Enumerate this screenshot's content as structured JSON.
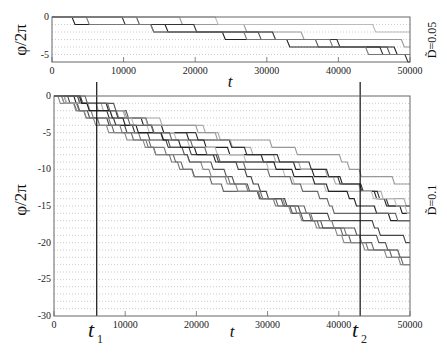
{
  "chart_data": [
    {
      "type": "line",
      "panel": "top",
      "ylabel": "φ/2π",
      "xlabel": "t",
      "right_label": "D̃=0.05",
      "xlim": [
        0,
        50000
      ],
      "ylim": [
        -6,
        0
      ],
      "xticks": [
        0,
        10000,
        20000,
        30000,
        40000,
        50000
      ],
      "yticks": [
        0,
        -5
      ],
      "ytick_labels": [
        "0",
        "-5"
      ],
      "grid": "dotted horizontal at integer values",
      "series": [
        {
          "name": "traj1",
          "color": "#222",
          "steps": [
            [
              3000,
              -1
            ],
            [
              7000,
              -1
            ],
            [
              9000,
              -1
            ],
            [
              16000,
              -2
            ],
            [
              24000,
              -3
            ],
            [
              33000,
              -4
            ],
            [
              48000,
              -5
            ]
          ]
        },
        {
          "name": "traj2",
          "color": "#555",
          "steps": [
            [
              12000,
              -1
            ],
            [
              14000,
              -2
            ],
            [
              22000,
              -2
            ],
            [
              29000,
              -3
            ],
            [
              37000,
              -4
            ],
            [
              47000,
              -5
            ]
          ]
        },
        {
          "name": "traj3",
          "color": "#999",
          "steps": [
            [
              18000,
              -1
            ],
            [
              27000,
              -2
            ],
            [
              35000,
              -3
            ],
            [
              43000,
              -3
            ],
            [
              49000,
              -4
            ]
          ]
        },
        {
          "name": "traj4",
          "color": "#333",
          "steps": [
            [
              10000,
              -1
            ],
            [
              20000,
              -2
            ],
            [
              31000,
              -3
            ],
            [
              40000,
              -4
            ],
            [
              46000,
              -5
            ],
            [
              49500,
              -6
            ]
          ]
        },
        {
          "name": "traj5",
          "color": "#bbb",
          "steps": [
            [
              23000,
              -1
            ],
            [
              36000,
              -1
            ],
            [
              45000,
              -2
            ]
          ]
        },
        {
          "name": "traj6",
          "color": "#777",
          "steps": [
            [
              5000,
              -1
            ],
            [
              14000,
              -2
            ],
            [
              27000,
              -3
            ],
            [
              39000,
              -4
            ],
            [
              44000,
              -5
            ]
          ]
        }
      ]
    },
    {
      "type": "line",
      "panel": "bottom",
      "ylabel": "φ/2π",
      "xlabel": "t",
      "right_label": "D̃=0.1",
      "xlim": [
        0,
        50000
      ],
      "ylim": [
        -30,
        0
      ],
      "xticks": [
        0,
        10000,
        20000,
        30000,
        40000,
        50000
      ],
      "yticks": [
        0,
        -5,
        -10,
        -15,
        -20,
        -25,
        -30
      ],
      "ytick_labels": [
        "0",
        "-5",
        "-10",
        "-15",
        "-20",
        "-25",
        "-30"
      ],
      "grid": "dotted horizontal at integer values",
      "vlines": [
        {
          "label": "t1",
          "x": 6000
        },
        {
          "label": "t2",
          "x": 43000
        }
      ],
      "series": [
        {
          "name": "traj1",
          "color": "#222",
          "end": -18,
          "rate": 0.00042,
          "seed": 1
        },
        {
          "name": "traj2",
          "color": "#444",
          "end": -20,
          "rate": 0.00047,
          "seed": 2
        },
        {
          "name": "traj3",
          "color": "#666",
          "end": -24,
          "rate": 0.00052,
          "seed": 3
        },
        {
          "name": "traj4",
          "color": "#888",
          "end": -26,
          "rate": 0.00056,
          "seed": 4
        },
        {
          "name": "traj5",
          "color": "#aaa",
          "end": -22,
          "rate": 0.0005,
          "seed": 5
        },
        {
          "name": "traj6",
          "color": "#333",
          "end": -17,
          "rate": 0.00038,
          "seed": 6
        },
        {
          "name": "traj7",
          "color": "#555",
          "end": -25,
          "rate": 0.00053,
          "seed": 7
        },
        {
          "name": "traj8",
          "color": "#777",
          "end": -27,
          "rate": 0.00058,
          "seed": 8
        },
        {
          "name": "traj9",
          "color": "#bbb",
          "end": -19,
          "rate": 0.00044,
          "seed": 9
        },
        {
          "name": "traj10",
          "color": "#999",
          "end": -16,
          "rate": 0.00036,
          "seed": 10
        },
        {
          "name": "traj11",
          "color": "#222",
          "end": -21,
          "rate": 0.00048,
          "seed": 11
        },
        {
          "name": "traj12",
          "color": "#666",
          "end": -23,
          "rate": 0.00051,
          "seed": 12
        }
      ]
    }
  ],
  "labels": {
    "top_ylabel": "φ/2π",
    "top_xlabel": "t",
    "top_right": "D̃=0.05",
    "bottom_ylabel": "φ/2π",
    "bottom_xlabel": "t",
    "bottom_right": "D̃=0.1",
    "t1": "t",
    "t1_sub": "1",
    "t2": "t",
    "t2_sub": "2"
  }
}
